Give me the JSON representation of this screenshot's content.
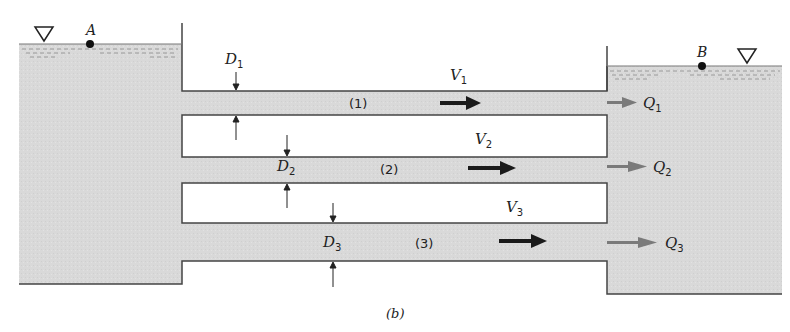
{
  "figure": {
    "caption": "(b)",
    "reservoirs": [
      {
        "id": "A",
        "label": "A",
        "side": "left"
      },
      {
        "id": "B",
        "label": "B",
        "side": "right"
      }
    ],
    "pipes": [
      {
        "id": "1",
        "number_label": "(1)",
        "diameter_label": "D",
        "diameter_sub": "1",
        "velocity_label": "V",
        "velocity_sub": "1",
        "flow_label": "Q",
        "flow_sub": "1"
      },
      {
        "id": "2",
        "number_label": "(2)",
        "diameter_label": "D",
        "diameter_sub": "2",
        "velocity_label": "V",
        "velocity_sub": "2",
        "flow_label": "Q",
        "flow_sub": "2"
      },
      {
        "id": "3",
        "number_label": "(3)",
        "diameter_label": "D",
        "diameter_sub": "3",
        "velocity_label": "V",
        "velocity_sub": "3",
        "flow_label": "Q",
        "flow_sub": "3"
      }
    ],
    "colors": {
      "water": "#d9d9d9",
      "wall": "#444444",
      "velocity_arrow": "#1a1a1a",
      "flow_arrow": "#7a7a7a"
    }
  }
}
